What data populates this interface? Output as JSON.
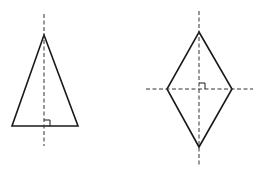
{
  "diagram": {
    "colors": {
      "stroke": "#1a1a1a",
      "dash": "#333333",
      "background": "#ffffff"
    },
    "shapes": [
      {
        "id": "isosceles-triangle",
        "points": [
          [
            44,
            35
          ],
          [
            78,
            126
          ],
          [
            12,
            126
          ]
        ],
        "axes": [
          {
            "orientation": "vertical",
            "from": [
              44,
              14
            ],
            "to": [
              44,
              146
            ]
          }
        ],
        "right_angle_marker": {
          "x": 44,
          "y": 120,
          "size": 6
        }
      },
      {
        "id": "rhombus",
        "points": [
          [
            199,
            32
          ],
          [
            232,
            89
          ],
          [
            199,
            147
          ],
          [
            167,
            89
          ]
        ],
        "axes": [
          {
            "orientation": "vertical",
            "from": [
              199,
              11
            ],
            "to": [
              199,
              167
            ]
          },
          {
            "orientation": "horizontal",
            "from": [
              146,
              89
            ],
            "to": [
              253,
              89
            ]
          }
        ],
        "right_angle_marker": {
          "x": 199,
          "y": 83,
          "size": 6
        }
      }
    ]
  }
}
